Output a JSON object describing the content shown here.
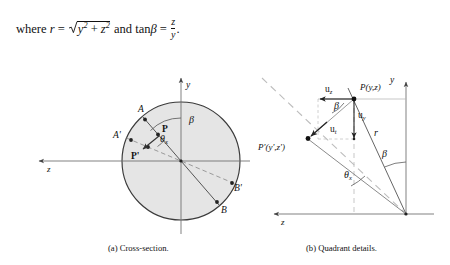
{
  "document": {
    "background_color": "#ffffff",
    "ink_color": "#111111",
    "disk_fill_color": "#e4e4e4",
    "dashed_color": "#9a9a9a"
  },
  "formula": {
    "lead": "where",
    "var_r": "r",
    "equals": "=",
    "radicand_y": "y",
    "radicand_y_exp": "2",
    "plus": "+",
    "radicand_z": "z",
    "radicand_z_exp": "2",
    "and": "and",
    "tan": "tan",
    "beta": "β",
    "equals2": "=",
    "frac_num": "z",
    "frac_den": "y",
    "period": "."
  },
  "figure_a": {
    "caption": "(a) Cross-section.",
    "axis_y_label": "y",
    "axis_z_label": "z",
    "labels": [
      {
        "id": "A",
        "text": "A"
      },
      {
        "id": "P",
        "text": "P"
      },
      {
        "id": "Ap",
        "text": "A'"
      },
      {
        "id": "Pp",
        "text": "P'"
      },
      {
        "id": "B",
        "text": "B"
      },
      {
        "id": "Bp",
        "text": "B'"
      },
      {
        "id": "beta",
        "text": "β"
      },
      {
        "id": "thetax",
        "text": "θ"
      },
      {
        "id": "thetax_sub",
        "text": "x"
      }
    ]
  },
  "figure_b": {
    "caption": "(b) Quadrant details.",
    "axis_y_label": "y",
    "axis_z_label": "z",
    "labels": [
      {
        "id": "uz",
        "text": "u",
        "sub": "z"
      },
      {
        "id": "uy",
        "text": "u",
        "sub": "y"
      },
      {
        "id": "ut",
        "text": "u",
        "sub": "t"
      },
      {
        "id": "P",
        "text": "P(y,z)"
      },
      {
        "id": "Pp",
        "text": "P'(y',z')"
      },
      {
        "id": "r",
        "text": "r"
      },
      {
        "id": "beta_top",
        "text": "β"
      },
      {
        "id": "beta_right",
        "text": "β"
      },
      {
        "id": "thetax",
        "text": "θ",
        "sub": "x"
      }
    ]
  }
}
